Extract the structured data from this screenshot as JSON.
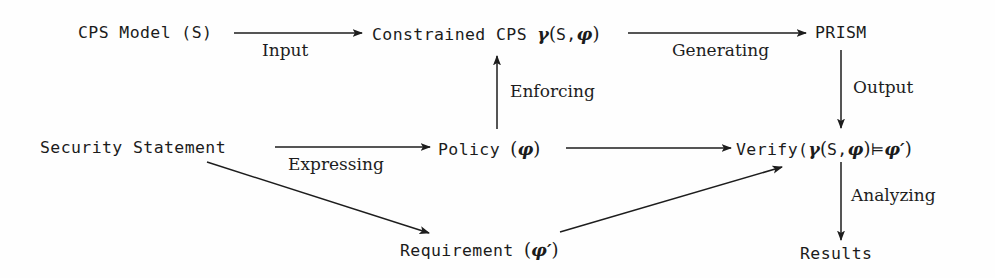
{
  "diagram": {
    "background_color": "#fefefe",
    "stroke_color": "#1d1d1d",
    "nodes": [
      {
        "id": "cps_model",
        "label": "CPS Model (S)",
        "text_plain": "CPS Model (S)"
      },
      {
        "id": "constrained",
        "label": "Constrained CPS",
        "text_plain": "Constrained CPS γ(S, φ)"
      },
      {
        "id": "prism",
        "label": "PRISM",
        "text_plain": "PRISM"
      },
      {
        "id": "security_stmt",
        "label": "Security Statement",
        "text_plain": "Security Statement"
      },
      {
        "id": "policy",
        "label": "Policy",
        "text_plain": "Policy (φ)"
      },
      {
        "id": "verify",
        "label": "Verify",
        "text_plain": "Verify(γ(S, φ) ⊨ φ′)"
      },
      {
        "id": "requirement",
        "label": "Requirement",
        "text_plain": "Requirement (φ′)"
      },
      {
        "id": "results",
        "label": "Results",
        "text_plain": "Results"
      }
    ],
    "node_text": {
      "cps_model": "CPS Model (S)",
      "constrained_prefix": "Constrained CPS ",
      "constrained_gamma": "γ",
      "constrained_open": "(",
      "constrained_s": "S,",
      "constrained_phi": "φ",
      "constrained_close": ")",
      "prism": "PRISM",
      "security_statement": "Security Statement",
      "policy_prefix": "Policy ",
      "policy_open": "(",
      "policy_phi": "φ",
      "policy_close": ")",
      "verify_prefix": "Verify(",
      "verify_gamma": "γ",
      "verify_open": "(",
      "verify_s": "S,",
      "verify_phi": "φ",
      "verify_close": ")",
      "verify_turnstile": "⊨",
      "verify_phi_prime": "φ′",
      "verify_end": ")",
      "requirement_prefix": "Requirement ",
      "requirement_open": "(",
      "requirement_phi_prime": "φ′",
      "requirement_close": ")",
      "results": "Results"
    },
    "edges": [
      {
        "id": "input",
        "from": "cps_model",
        "to": "constrained",
        "label": "Input"
      },
      {
        "id": "generating",
        "from": "constrained",
        "to": "prism",
        "label": "Generating"
      },
      {
        "id": "output",
        "from": "prism",
        "to": "verify",
        "label": "Output"
      },
      {
        "id": "enforcing",
        "from": "policy",
        "to": "constrained",
        "label": "Enforcing"
      },
      {
        "id": "expressing",
        "from": "security_stmt",
        "to": "policy",
        "label": "Expressing"
      },
      {
        "id": "to_req",
        "from": "security_stmt",
        "to": "requirement",
        "label": ""
      },
      {
        "id": "policy_ver",
        "from": "policy",
        "to": "verify",
        "label": ""
      },
      {
        "id": "req_ver",
        "from": "requirement",
        "to": "verify",
        "label": ""
      },
      {
        "id": "analyzing",
        "from": "verify",
        "to": "results",
        "label": "Analyzing"
      }
    ],
    "edge_labels": {
      "input": "Input",
      "generating": "Generating",
      "output": "Output",
      "enforcing": "Enforcing",
      "expressing": "Expressing",
      "analyzing": "Analyzing"
    }
  }
}
